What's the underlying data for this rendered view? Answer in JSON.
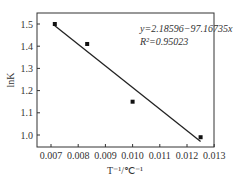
{
  "chart_data": {
    "type": "scatter",
    "title": "",
    "xlabel": "T⁻¹/℃⁻¹",
    "ylabel": "lnK",
    "xlim": [
      0.0065,
      0.0131
    ],
    "ylim": [
      0.95,
      1.55
    ],
    "x_ticks": [
      "0.007",
      "0.008",
      "0.009",
      "0.010",
      "0.011",
      "0.012",
      "0.013"
    ],
    "y_ticks": [
      "1.0",
      "1.1",
      "1.2",
      "1.3",
      "1.4",
      "1.5"
    ],
    "grid": false,
    "series": [
      {
        "name": "data",
        "x": [
          0.00714,
          0.00833,
          0.01,
          0.0125
        ],
        "y": [
          1.5,
          1.41,
          1.15,
          0.99
        ]
      }
    ],
    "fit_line": {
      "x": [
        0.00714,
        0.0125
      ],
      "y": [
        1.492,
        0.971
      ]
    },
    "annotations": [
      "y=2.18596−97.16735x",
      "R²=0.95023"
    ]
  }
}
